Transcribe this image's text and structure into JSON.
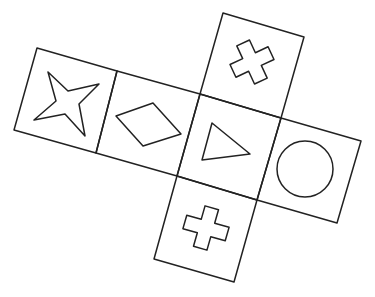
{
  "diagram": {
    "type": "cube-net",
    "stroke_color": "#222222",
    "background_color": "#ffffff",
    "faces": [
      {
        "id": "face-star",
        "symbol": "four-pointed-star",
        "position": "left"
      },
      {
        "id": "face-diamond",
        "symbol": "rhombus",
        "position": "center-left"
      },
      {
        "id": "face-triangle",
        "symbol": "triangle",
        "position": "center"
      },
      {
        "id": "face-circle",
        "symbol": "circle",
        "position": "right"
      },
      {
        "id": "face-cross-top",
        "symbol": "cross",
        "position": "top"
      },
      {
        "id": "face-cross-bottom",
        "symbol": "cross",
        "position": "bottom"
      }
    ]
  }
}
